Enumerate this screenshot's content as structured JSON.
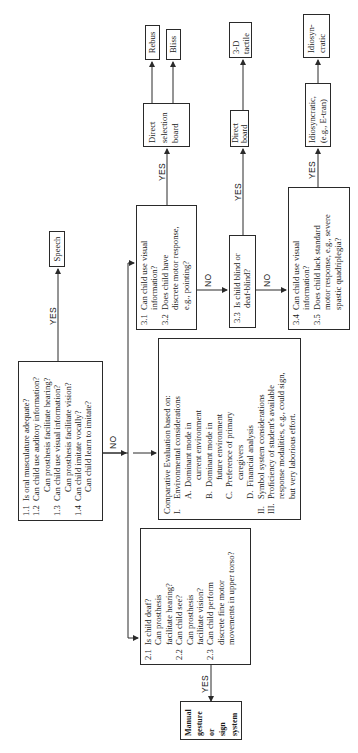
{
  "diagram": {
    "type": "flowchart",
    "orientation": "rotated-90-ccw",
    "box1": {
      "lines": [
        {
          "num": "1.1",
          "text": "Is oral musculature adequate?"
        },
        {
          "num": "1.2",
          "text": "Can child use auditory information?"
        },
        {
          "num": "",
          "text": "Can prosthesis facilitate hearing?"
        },
        {
          "num": "1.3",
          "text": "Can child use visual information?"
        },
        {
          "num": "",
          "text": "Can prosthesis facilitate vision?"
        },
        {
          "num": "1.4",
          "text": "Can child imitate vocally?"
        },
        {
          "num": "",
          "text": "Can child learn to imitate?"
        }
      ]
    },
    "speech": {
      "label": "Speech"
    },
    "comparative": {
      "title": "Comparative Evaluation based on:",
      "items": [
        {
          "roman": "I.",
          "text": "Environmental considerations"
        },
        {
          "alpha": "A.",
          "text": "Dominant mode in"
        },
        {
          "cont": "current environment"
        },
        {
          "alpha": "B.",
          "text": "Dominant mode in"
        },
        {
          "cont": "future environment"
        },
        {
          "alpha": "C.",
          "text": "Preference of primary"
        },
        {
          "cont": "caregivers"
        },
        {
          "alpha": "D.",
          "text": "Financial analysis"
        },
        {
          "roman": "II.",
          "text": "Symbol system considerations"
        },
        {
          "roman": "III.",
          "text": "Proficiency of student's available"
        },
        {
          "cont": "response modalities, e.g., could sign,"
        },
        {
          "cont": "but very laborious effort."
        }
      ]
    },
    "box2": {
      "lines": [
        {
          "num": "2.1",
          "text": "Is child deaf?"
        },
        {
          "num": "",
          "text": "Can prosthesis"
        },
        {
          "num": "",
          "text": "facilitate hearing?"
        },
        {
          "num": "2.2",
          "text": "Can child see?"
        },
        {
          "num": "",
          "text": "Can prosthesis"
        },
        {
          "num": "",
          "text": "facilitate vision?"
        },
        {
          "num": "2.3",
          "text": "Can child perform"
        },
        {
          "num": "",
          "text": "discrete fine motor"
        },
        {
          "num": "",
          "text": "movements in upper torso?"
        }
      ]
    },
    "manual": {
      "lines": [
        "Manual",
        "gesture",
        "or",
        "sign",
        "system"
      ]
    },
    "box31": {
      "lines": [
        {
          "num": "3.1",
          "text": "Can child use visual"
        },
        {
          "num": "",
          "text": "information?"
        },
        {
          "num": "3.2",
          "text": "Does child have"
        },
        {
          "num": "",
          "text": "discrete motor response,"
        },
        {
          "num": "",
          "text": "e.g., pointing?"
        }
      ]
    },
    "box33": {
      "lines": [
        {
          "num": "3.3",
          "text": "Is child blind or"
        },
        {
          "num": "",
          "text": "deaf-blind?"
        }
      ]
    },
    "box34": {
      "lines": [
        {
          "num": "3.4",
          "text": "Can child use visual"
        },
        {
          "num": "",
          "text": "information?"
        },
        {
          "num": "3.5",
          "text": "Does child lack standard"
        },
        {
          "num": "",
          "text": "motor response, e.g., severe"
        },
        {
          "num": "",
          "text": "spastic quadriplegia?"
        }
      ]
    },
    "direct_selection": {
      "lines": [
        "Direct",
        "selection",
        "board"
      ]
    },
    "rebus": {
      "label": "Rebus"
    },
    "bliss": {
      "label": "Bliss"
    },
    "direct_board": {
      "lines": [
        "Direct",
        "board"
      ]
    },
    "tactile": {
      "lines": [
        "3-D",
        "tactile"
      ]
    },
    "idio_eg": {
      "lines": [
        "Idiosyncratic,",
        "(e.g., E-tran)"
      ]
    },
    "idio": {
      "lines": [
        "Idiosyn-",
        "cratic"
      ]
    },
    "edge_labels": {
      "yes": "YES",
      "no": "NO"
    },
    "colors": {
      "line": "#2a2a2a",
      "background": "#ffffff",
      "text": "#1a1a1a"
    }
  }
}
